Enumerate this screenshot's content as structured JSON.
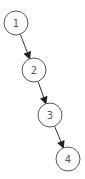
{
  "diagram": {
    "type": "linked-list-tree",
    "nodes": [
      {
        "id": "1",
        "label": "1",
        "cx": 16,
        "cy": 23,
        "r": 12
      },
      {
        "id": "2",
        "label": "2",
        "cx": 34,
        "cy": 70,
        "r": 12
      },
      {
        "id": "3",
        "label": "3",
        "cx": 50,
        "cy": 115,
        "r": 12
      },
      {
        "id": "4",
        "label": "4",
        "cx": 68,
        "cy": 159,
        "r": 12
      }
    ],
    "edges": [
      {
        "from": "1",
        "to": "2"
      },
      {
        "from": "2",
        "to": "3"
      },
      {
        "from": "3",
        "to": "4"
      }
    ],
    "colors": {
      "stroke": "#555555",
      "edge": "#333333",
      "background": "#ffffff"
    }
  }
}
